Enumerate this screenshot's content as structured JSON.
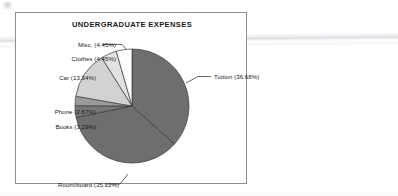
{
  "figure": {
    "title": "UNDERGRADUATE EXPENSES",
    "frame_color": "#8d8f92",
    "background": "#ffffff"
  },
  "chart_data": {
    "type": "pie",
    "title": "UNDERGRADUATE EXPENSES",
    "xlabel": "",
    "ylabel": "",
    "units": "percent",
    "total": 100.0,
    "legend": "none (labels with leader lines around pie)",
    "grid": false,
    "start_angle_deg": 0,
    "direction": "clockwise",
    "categories": [
      "Tuition",
      "Room/board",
      "Books",
      "Phone",
      "Car",
      "Clothes",
      "Misc."
    ],
    "values": [
      36.68,
      35.12,
      3.29,
      2.67,
      13.34,
      4.45,
      4.45
    ],
    "slices": [
      {
        "name": "Tuition",
        "label": "Tuition (36.68%)",
        "value": 36.68,
        "color": "#6e6e6e",
        "label_position": "right"
      },
      {
        "name": "Room/board",
        "label": "Room/board (35.12%)",
        "value": 35.12,
        "color": "#6e6e6e",
        "label_position": "bottom-left"
      },
      {
        "name": "Books",
        "label": "Books (3.29%)",
        "value": 3.29,
        "color": "#777777",
        "label_position": "left"
      },
      {
        "name": "Phone",
        "label": "Phone (2.67%)",
        "value": 2.67,
        "color": "#9a9a9a",
        "label_position": "left"
      },
      {
        "name": "Car",
        "label": "Car (13.34%)",
        "value": 13.34,
        "color": "#d2d2d2",
        "label_position": "upper-left"
      },
      {
        "name": "Clothes",
        "label": "Clothes (4.45%)",
        "value": 4.45,
        "color": "#e2e2e2",
        "label_position": "upper-left"
      },
      {
        "name": "Misc.",
        "label": "Misc. (4.45%)",
        "value": 4.45,
        "color": "#fdfdfd",
        "label_position": "top"
      }
    ]
  }
}
